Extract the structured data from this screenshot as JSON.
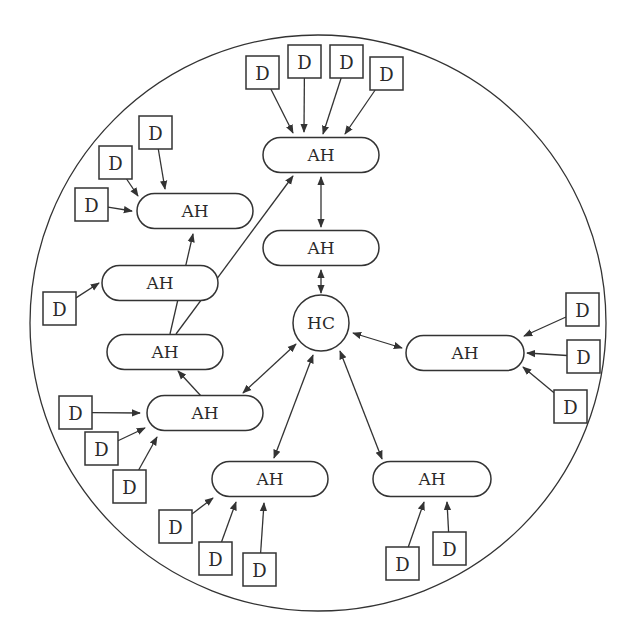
{
  "diagram": {
    "boundary": {
      "cx": 318,
      "cy": 323,
      "r": 288
    },
    "colors": {
      "stroke": "#333333",
      "text": "#2a2a2a",
      "background": "#ffffff"
    },
    "hub": {
      "id": "HC",
      "label": "HC",
      "cx": 321,
      "cy": 323,
      "r": 28
    },
    "access_hubs": [
      {
        "id": "ah_top",
        "label": "AH",
        "cx": 321,
        "cy": 155,
        "w": 116,
        "h": 35
      },
      {
        "id": "ah_mid",
        "label": "AH",
        "cx": 321,
        "cy": 248,
        "w": 116,
        "h": 35
      },
      {
        "id": "ah_upleft",
        "label": "AH",
        "cx": 195,
        "cy": 211,
        "w": 116,
        "h": 35
      },
      {
        "id": "ah_left1",
        "label": "AH",
        "cx": 160,
        "cy": 283,
        "w": 116,
        "h": 35
      },
      {
        "id": "ah_left2",
        "label": "AH",
        "cx": 165,
        "cy": 352,
        "w": 116,
        "h": 35
      },
      {
        "id": "ah_lowleft",
        "label": "AH",
        "cx": 205,
        "cy": 413,
        "w": 116,
        "h": 35
      },
      {
        "id": "ah_right",
        "label": "AH",
        "cx": 465,
        "cy": 353,
        "w": 118,
        "h": 35
      },
      {
        "id": "ah_botmid",
        "label": "AH",
        "cx": 270,
        "cy": 479,
        "w": 116,
        "h": 35
      },
      {
        "id": "ah_botright",
        "label": "AH",
        "cx": 432,
        "cy": 479,
        "w": 118,
        "h": 35
      }
    ],
    "devices": [
      {
        "id": "d1",
        "label": "D",
        "x": 246,
        "y": 56,
        "target": "ah_top",
        "tx": 293,
        "ty": 133
      },
      {
        "id": "d2",
        "label": "D",
        "x": 288,
        "y": 45,
        "target": "ah_top",
        "tx": 304,
        "ty": 132
      },
      {
        "id": "d3",
        "label": "D",
        "x": 330,
        "y": 45,
        "target": "ah_top",
        "tx": 323,
        "ty": 134
      },
      {
        "id": "d4",
        "label": "D",
        "x": 370,
        "y": 57,
        "target": "ah_top",
        "tx": 345,
        "ty": 134
      },
      {
        "id": "d5",
        "label": "D",
        "x": 139,
        "y": 116,
        "target": "ah_upleft",
        "tx": 165,
        "ty": 189
      },
      {
        "id": "d6",
        "label": "D",
        "x": 99,
        "y": 146,
        "target": "ah_upleft",
        "tx": 138,
        "ty": 196
      },
      {
        "id": "d7",
        "label": "D",
        "x": 75,
        "y": 188,
        "target": "ah_upleft",
        "tx": 132,
        "ty": 211
      },
      {
        "id": "d8",
        "label": "D",
        "x": 43,
        "y": 292,
        "target": "ah_left1",
        "tx": 99,
        "ty": 283
      },
      {
        "id": "d9",
        "label": "D",
        "x": 59,
        "y": 396,
        "target": "ah_lowleft",
        "tx": 140,
        "ty": 413
      },
      {
        "id": "d10",
        "label": "D",
        "x": 85,
        "y": 432,
        "target": "ah_lowleft",
        "tx": 145,
        "ty": 428
      },
      {
        "id": "d11",
        "label": "D",
        "x": 113,
        "y": 470,
        "target": "ah_lowleft",
        "tx": 157,
        "ty": 437
      },
      {
        "id": "d12",
        "label": "D",
        "x": 159,
        "y": 510,
        "target": "ah_botmid",
        "tx": 213,
        "ty": 498
      },
      {
        "id": "d13",
        "label": "D",
        "x": 199,
        "y": 542,
        "target": "ah_botmid",
        "tx": 236,
        "ty": 502
      },
      {
        "id": "d14",
        "label": "D",
        "x": 243,
        "y": 553,
        "target": "ah_botmid",
        "tx": 264,
        "ty": 503
      },
      {
        "id": "d15",
        "label": "D",
        "x": 386,
        "y": 547,
        "target": "ah_botright",
        "tx": 424,
        "ty": 502
      },
      {
        "id": "d16",
        "label": "D",
        "x": 433,
        "y": 532,
        "target": "ah_botright",
        "tx": 447,
        "ty": 502
      },
      {
        "id": "d17",
        "label": "D",
        "x": 566,
        "y": 293,
        "target": "ah_right",
        "tx": 524,
        "ty": 336
      },
      {
        "id": "d18",
        "label": "D",
        "x": 567,
        "y": 340,
        "target": "ah_right",
        "tx": 527,
        "ty": 353
      },
      {
        "id": "d19",
        "label": "D",
        "x": 554,
        "y": 390,
        "target": "ah_right",
        "tx": 523,
        "ty": 367
      }
    ],
    "edges": [
      {
        "from": "ah_top",
        "to": "ah_mid",
        "x1": 321,
        "y1": 177,
        "x2": 321,
        "y2": 227,
        "type": "bidirectional"
      },
      {
        "from": "ah_mid",
        "to": "HC",
        "x1": 321,
        "y1": 270,
        "x2": 321,
        "y2": 293,
        "type": "bidirectional"
      },
      {
        "from": "HC",
        "to": "ah_right",
        "x1": 353,
        "y1": 333,
        "x2": 402,
        "y2": 348,
        "type": "bidirectional"
      },
      {
        "from": "HC",
        "to": "ah_lowleft",
        "x1": 296,
        "y1": 344,
        "x2": 243,
        "y2": 393,
        "type": "bidirectional"
      },
      {
        "from": "HC",
        "to": "ah_botmid",
        "x1": 313,
        "y1": 355,
        "x2": 274,
        "y2": 458,
        "type": "bidirectional"
      },
      {
        "from": "HC",
        "to": "ah_botright",
        "x1": 340,
        "y1": 351,
        "x2": 382,
        "y2": 459,
        "type": "bidirectional"
      },
      {
        "from": "ah_lowleft",
        "to": "ah_left2",
        "x1": 201,
        "y1": 396,
        "x2": 178,
        "y2": 371,
        "type": "directed"
      },
      {
        "from": "ah_left2",
        "to": "ah_upleft",
        "x1": 170,
        "y1": 334,
        "x2": 193,
        "y2": 234,
        "type": "directed",
        "via": "passes through ah_left1"
      },
      {
        "from": "ah_left2",
        "to": "ah_top",
        "x1": 176,
        "y1": 334,
        "x2": 293,
        "y2": 176,
        "type": "directed",
        "via": "passes through ah_left1"
      }
    ]
  }
}
